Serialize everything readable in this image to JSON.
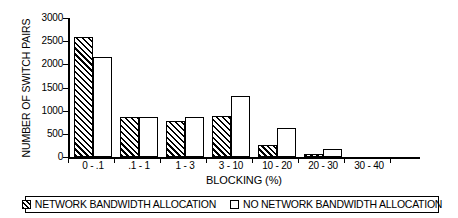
{
  "chart_data": {
    "type": "bar",
    "title": "",
    "subtitle": "",
    "xlabel": "BLOCKING (%)",
    "ylabel": "NUMBER OF SWITCH PAIRS",
    "categories": [
      "0 - .1",
      ".1 - 1",
      "1 - 3",
      "3 - 10",
      "10 - 20",
      "20 - 30",
      "30 - 40"
    ],
    "series": [
      {
        "name": "NETWORK BANDWIDTH ALLOCATION",
        "pattern": "diagonal-hatch",
        "values": [
          2600,
          870,
          780,
          880,
          250,
          40,
          0
        ]
      },
      {
        "name": "NO NETWORK BANDWIDTH ALLOCATION",
        "pattern": "solid-white",
        "values": [
          2150,
          870,
          870,
          1310,
          630,
          180,
          0
        ]
      }
    ],
    "ylim": [
      0,
      3000
    ],
    "yticks": [
      0,
      500,
      1000,
      1500,
      2000,
      2500,
      3000
    ],
    "ytick_labels": [
      "0",
      "500",
      "1000",
      "1500",
      "2000",
      "2500",
      "3000"
    ],
    "grid": false,
    "legend_position": "bottom",
    "colors": {
      "foreground": "#000000",
      "background": "#ffffff",
      "bar_fill": "#ffffff",
      "bar_edge": "#000000"
    }
  },
  "legend": {
    "entries": [
      {
        "label": "NETWORK BANDWIDTH ALLOCATION",
        "swatch": "hatched-square-icon"
      },
      {
        "label": "NO NETWORK BANDWIDTH ALLOCATION",
        "swatch": "empty-square-icon"
      }
    ]
  }
}
